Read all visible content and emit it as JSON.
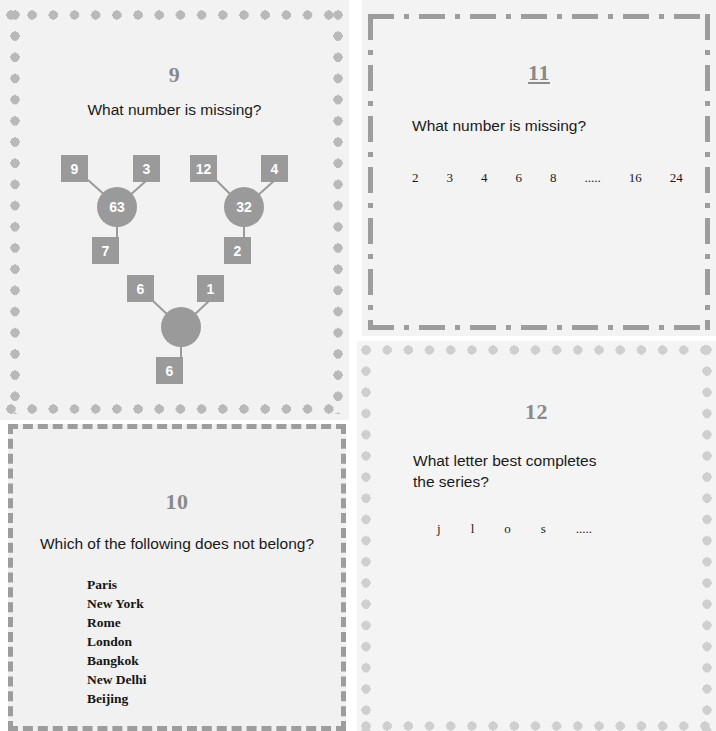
{
  "colors": {
    "panel_bg": "#f2f2f2",
    "panel_bg_light": "#f4f4f4",
    "dot_border": "#b9b9b9",
    "dot_border_light": "#cfcfcf",
    "dash_border": "#9d9d9d",
    "node_fill": "#9a9a9a",
    "node_text": "#ffffff",
    "title_color": "#8a8a8a",
    "body_text": "#1a1a1a"
  },
  "panels": {
    "p9": {
      "number": "9",
      "question": "What number is missing?",
      "border_style": "dotted",
      "diagram": {
        "type": "number-triangles",
        "groups": [
          {
            "name": "left-triangle",
            "top_left": "9",
            "top_right": "3",
            "center": "63",
            "bottom": "7"
          },
          {
            "name": "right-triangle",
            "top_left": "12",
            "top_right": "4",
            "center": "32",
            "bottom": "2"
          },
          {
            "name": "bottom-triangle",
            "top_left": "6",
            "top_right": "1",
            "center": "",
            "bottom": "6"
          }
        ]
      }
    },
    "p10": {
      "number": "10",
      "question": "Which of the following does not belong?",
      "border_style": "dashed",
      "options": [
        "Paris",
        "New York",
        "Rome",
        "London",
        "Bangkok",
        "New Delhi",
        "Beijing"
      ]
    },
    "p11": {
      "number": "11",
      "question": "What number is missing?",
      "border_style": "dash-dot",
      "sequence": [
        "2",
        "3",
        "4",
        "6",
        "8",
        ".....",
        "16",
        "24"
      ]
    },
    "p12": {
      "number": "12",
      "question": "What letter best completes the series?",
      "border_style": "dotted",
      "sequence": [
        "j",
        "l",
        "o",
        "s",
        "....."
      ]
    }
  }
}
